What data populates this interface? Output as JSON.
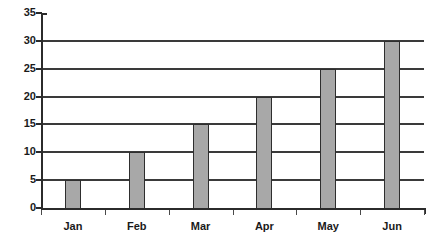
{
  "chart_data": {
    "type": "bar",
    "title": "",
    "subtitle": "",
    "xlabel": "",
    "ylabel": "",
    "categories": [
      "Jan",
      "Feb",
      "Mar",
      "Apr",
      "May",
      "Jun"
    ],
    "values": [
      5,
      10,
      15,
      20,
      25,
      30
    ],
    "ylim": [
      0,
      35
    ],
    "ytick_labels": [
      "35",
      "30",
      "25",
      "20",
      "15",
      "10",
      "5",
      "0"
    ],
    "ytick_values": [
      35,
      30,
      25,
      20,
      15,
      10,
      5,
      0
    ],
    "ytick_interval": 5,
    "grid": true,
    "grid_axis": "y",
    "legend": false,
    "legend_position": "none",
    "annotations": [],
    "colors": {
      "bar_fill": "#a8a8a8",
      "bar_border": "#2e2e2e",
      "gridline": "#3a3a3a",
      "axis": "#2b2b2b",
      "text": "#1a1a1a",
      "background": "#ffffff"
    }
  }
}
